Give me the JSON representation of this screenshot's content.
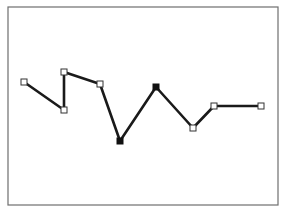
{
  "diagram": {
    "type": "polyline",
    "frame": {
      "x": 8,
      "y": 7,
      "width": 270,
      "height": 198
    },
    "vertices": [
      {
        "x": 24,
        "y": 82,
        "style": "hollow"
      },
      {
        "x": 64,
        "y": 110,
        "style": "hollow"
      },
      {
        "x": 64,
        "y": 72,
        "style": "hollow"
      },
      {
        "x": 100,
        "y": 84,
        "style": "hollow"
      },
      {
        "x": 120,
        "y": 141,
        "style": "filled"
      },
      {
        "x": 156,
        "y": 87,
        "style": "filled"
      },
      {
        "x": 193,
        "y": 128,
        "style": "hollow"
      },
      {
        "x": 214,
        "y": 106,
        "style": "hollow"
      },
      {
        "x": 261,
        "y": 106,
        "style": "hollow"
      }
    ],
    "colors": {
      "line": "#1a1a1a",
      "frame": "#6e6e6e",
      "background": "#ffffff"
    }
  }
}
